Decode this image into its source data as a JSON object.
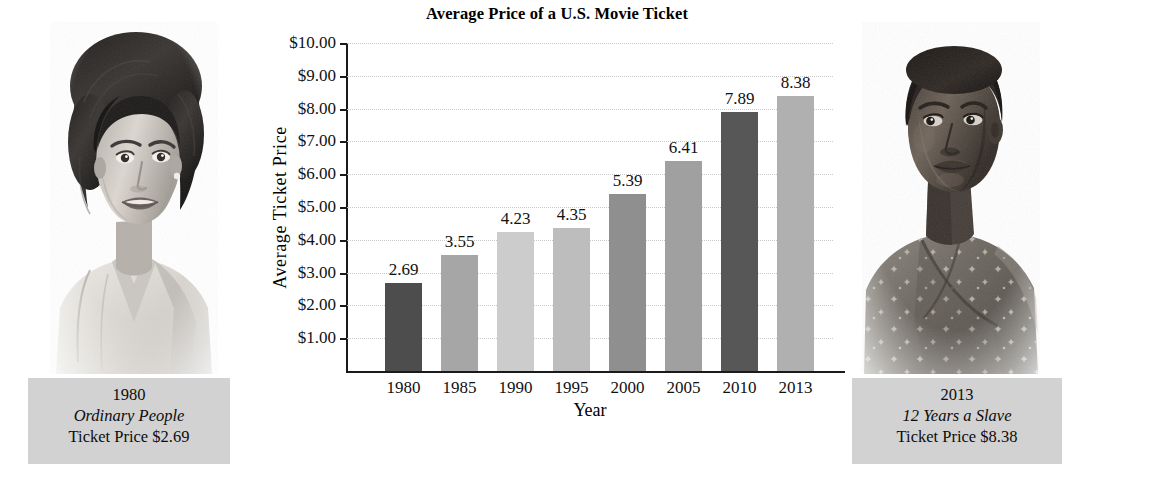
{
  "chart_data": {
    "type": "bar",
    "title": "Average Price of a U.S. Movie Ticket",
    "xlabel": "Year",
    "ylabel": "Average Ticket Price",
    "categories": [
      "1980",
      "1985",
      "1990",
      "1995",
      "2000",
      "2005",
      "2010",
      "2013"
    ],
    "values": [
      2.69,
      3.55,
      4.23,
      4.35,
      5.39,
      6.41,
      7.89,
      8.38
    ],
    "value_labels": [
      "2.69",
      "3.55",
      "4.23",
      "4.35",
      "5.39",
      "6.41",
      "7.89",
      "8.38"
    ],
    "bar_colors": [
      "#4d4d4d",
      "#a6a6a6",
      "#cccccc",
      "#bdbdbd",
      "#8f8f8f",
      "#a0a0a0",
      "#575757",
      "#b0b0b0"
    ],
    "ylim": [
      0,
      10
    ],
    "ytick_values": [
      10,
      9,
      8,
      7,
      6,
      5,
      4,
      3,
      2,
      1
    ],
    "ytick_labels": [
      "$10.00",
      "$9.00",
      "$8.00",
      "$7.00",
      "$6.00",
      "$5.00",
      "$4.00",
      "$3.00",
      "$2.00",
      "$1.00"
    ],
    "grid": true,
    "legend": "none"
  },
  "chart": {
    "title": "Average Price of a U.S. Movie Ticket",
    "x_axis_title": "Year",
    "y_axis_title": "Average Ticket Price"
  },
  "left_panel": {
    "photo_alt": "portrait-1980-actress",
    "caption": {
      "year": "1980",
      "movie_title": "Ordinary People",
      "price_line": "Ticket Price $2.69"
    }
  },
  "right_panel": {
    "photo_alt": "portrait-2013-actress",
    "caption": {
      "year": "2013",
      "movie_title": "12 Years a Slave",
      "price_line": "Ticket Price $8.38"
    }
  },
  "colors": {
    "caption_background": "#d2d2d2",
    "axis": "#1a1a1a",
    "gridline": "#c9c9c9",
    "text": "#111111"
  }
}
